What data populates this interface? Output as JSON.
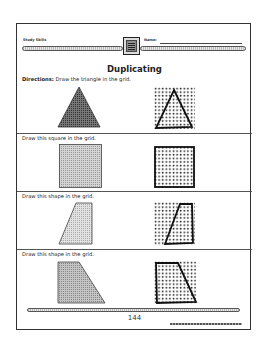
{
  "header": {
    "subject_label": "Study Skills",
    "name_label": "Name:"
  },
  "title": "Duplicating",
  "directions": {
    "prefix": "Directions:",
    "text": " Draw the triangle in the grid."
  },
  "exercises": [
    {
      "instruction": "",
      "shape": "triangle",
      "fill": "#555555"
    },
    {
      "instruction": "Draw this square in the grid.",
      "shape": "square",
      "fill": "#bdbdbd"
    },
    {
      "instruction": "Draw this shape in the grid.",
      "shape": "right-trapezoid-slanted-left",
      "fill": "#cfcfcf"
    },
    {
      "instruction": "Draw this shape in the grid.",
      "shape": "trapezoid-slanted-right",
      "fill": "#a9a9a9"
    }
  ],
  "footer": {
    "page_number": "144"
  },
  "colors": {
    "ink": "#222222",
    "border": "#333333",
    "paper": "#ffffff"
  }
}
